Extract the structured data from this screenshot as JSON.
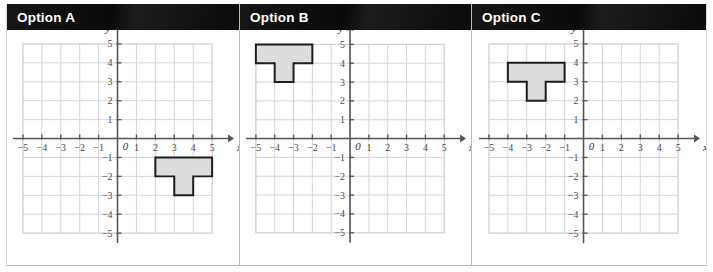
{
  "page": {
    "background": "#ffffff",
    "width": 713,
    "height": 272
  },
  "style": {
    "header_bg": "#0d0d0d",
    "header_text_color": "#ffffff",
    "grid_color": "#d5d5d8",
    "axis_color": "#555557",
    "shape_fill": "#dcdcdc",
    "shape_stroke": "#1d1d1d",
    "panel_divider": "#bdbdbd"
  },
  "panels": [
    {
      "id": "option-a",
      "title": "Option A",
      "chart_data": {
        "type": "scatter",
        "title": "Option A",
        "xlabel": "x",
        "ylabel": "y",
        "xlim": [
          -5,
          5
        ],
        "ylim": [
          -5,
          5
        ],
        "xticks": [
          -5,
          -4,
          -3,
          -2,
          -1,
          1,
          2,
          3,
          4,
          5
        ],
        "xtick_labels": [
          "−5",
          "−4",
          "−3",
          "−2",
          "−1",
          "1",
          "2",
          "3",
          "4",
          "5"
        ],
        "yticks": [
          -5,
          -4,
          -3,
          -2,
          -1,
          1,
          2,
          3,
          4,
          5
        ],
        "ytick_labels": [
          "−5",
          "−4",
          "−3",
          "−2",
          "−1",
          "1",
          "2",
          "3",
          "4",
          "5"
        ],
        "origin_label": "0",
        "grid": true,
        "grid_step": 1,
        "legend": "none",
        "annotations": [
          {
            "name": "t-shape",
            "description": "T-shaped polygon below the x-axis in quadrant IV, pointing downward",
            "fill": "#dcdcdc",
            "stroke": "#1d1d1d",
            "vertices": [
              [
                2,
                -1
              ],
              [
                5,
                -1
              ],
              [
                5,
                -2
              ],
              [
                4,
                -2
              ],
              [
                4,
                -3
              ],
              [
                3,
                -3
              ],
              [
                3,
                -2
              ],
              [
                2,
                -2
              ]
            ]
          }
        ]
      }
    },
    {
      "id": "option-b",
      "title": "Option B",
      "chart_data": {
        "type": "scatter",
        "title": "Option B",
        "xlabel": "x",
        "ylabel": "y",
        "xlim": [
          -5,
          5
        ],
        "ylim": [
          -5,
          5
        ],
        "xticks": [
          -5,
          -4,
          -3,
          -2,
          -1,
          1,
          2,
          3,
          4,
          5
        ],
        "xtick_labels": [
          "−5",
          "−4",
          "−3",
          "−2",
          "−1",
          "1",
          "2",
          "3",
          "4",
          "5"
        ],
        "yticks": [
          -5,
          -4,
          -3,
          -2,
          -1,
          1,
          2,
          3,
          4,
          5
        ],
        "ytick_labels": [
          "−5",
          "−4",
          "−3",
          "−2",
          "−1",
          "1",
          "2",
          "3",
          "4",
          "5"
        ],
        "origin_label": "0",
        "grid": true,
        "grid_step": 1,
        "legend": "none",
        "annotations": [
          {
            "name": "t-shape",
            "description": "T-shaped polygon in quadrant II, pointing downward",
            "fill": "#dcdcdc",
            "stroke": "#1d1d1d",
            "vertices": [
              [
                -5,
                5
              ],
              [
                -2,
                5
              ],
              [
                -2,
                4
              ],
              [
                -3,
                4
              ],
              [
                -3,
                3
              ],
              [
                -4,
                3
              ],
              [
                -4,
                4
              ],
              [
                -5,
                4
              ]
            ]
          }
        ]
      }
    },
    {
      "id": "option-c",
      "title": "Option C",
      "chart_data": {
        "type": "scatter",
        "title": "Option C",
        "xlabel": "x",
        "ylabel": "y",
        "xlim": [
          -5,
          5
        ],
        "ylim": [
          -5,
          5
        ],
        "xticks": [
          -5,
          -4,
          -3,
          -2,
          -1,
          1,
          2,
          3,
          4,
          5
        ],
        "xtick_labels": [
          "−5",
          "−4",
          "−3",
          "−2",
          "−1",
          "1",
          "2",
          "3",
          "4",
          "5"
        ],
        "yticks": [
          -5,
          -4,
          -3,
          -2,
          -1,
          1,
          2,
          3,
          4,
          5
        ],
        "ytick_labels": [
          "−5",
          "−4",
          "−3",
          "−2",
          "−1",
          "1",
          "2",
          "3",
          "4",
          "5"
        ],
        "origin_label": "0",
        "grid": true,
        "grid_step": 1,
        "legend": "none",
        "annotations": [
          {
            "name": "t-shape",
            "description": "T-shaped polygon in quadrant II, pointing downward",
            "fill": "#dcdcdc",
            "stroke": "#1d1d1d",
            "vertices": [
              [
                -4,
                4
              ],
              [
                -1,
                4
              ],
              [
                -1,
                3
              ],
              [
                -2,
                3
              ],
              [
                -2,
                2
              ],
              [
                -3,
                2
              ],
              [
                -3,
                3
              ],
              [
                -4,
                3
              ]
            ]
          }
        ]
      }
    }
  ]
}
